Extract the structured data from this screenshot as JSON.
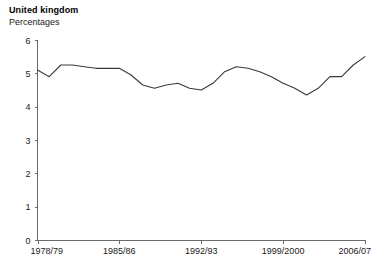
{
  "chart": {
    "title": "United kingdom",
    "subtitle": "Percentages"
  },
  "chart_data": {
    "type": "line",
    "title": "United kingdom",
    "subtitle": "Percentages",
    "xlabel": "",
    "ylabel": "",
    "ylim": [
      0,
      6
    ],
    "yticks": [
      0,
      1,
      2,
      3,
      4,
      5,
      6
    ],
    "ytick_labels": [
      "0",
      "1",
      "2",
      "3",
      "4",
      "5",
      "6"
    ],
    "grid": false,
    "legend": false,
    "line_color": "#3a3a3a",
    "xtick_labels": [
      "1978/79",
      "1985/86",
      "1992/93",
      "1999/2000",
      "2006/07"
    ],
    "xtick_indices": [
      0,
      7,
      14,
      21,
      28
    ],
    "categories": [
      "1978/79",
      "1979/80",
      "1980/81",
      "1981/82",
      "1982/83",
      "1983/84",
      "1984/85",
      "1985/86",
      "1986/87",
      "1987/88",
      "1988/89",
      "1989/90",
      "1990/91",
      "1991/92",
      "1992/93",
      "1993/94",
      "1994/95",
      "1995/96",
      "1996/97",
      "1997/98",
      "1998/99",
      "1999/2000",
      "2000/01",
      "2001/02",
      "2002/03",
      "2003/04",
      "2004/05",
      "2005/06",
      "2006/07"
    ],
    "series": [
      {
        "name": "Percentages",
        "values": [
          5.1,
          4.9,
          5.25,
          5.25,
          5.2,
          5.15,
          5.15,
          5.15,
          4.95,
          4.65,
          4.55,
          4.65,
          4.7,
          4.55,
          4.5,
          4.7,
          5.05,
          5.2,
          5.15,
          5.05,
          4.9,
          4.7,
          4.55,
          4.35,
          4.55,
          4.9,
          4.9,
          5.25,
          5.5
        ]
      }
    ]
  }
}
